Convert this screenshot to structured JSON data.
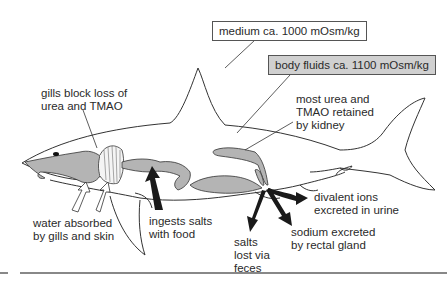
{
  "boxes": {
    "medium": "medium ca. 1000 mOsm/kg",
    "body_fluids": "body fluids ca. 1100 mOsm/kg"
  },
  "labels": {
    "gills_block": [
      "gills block loss of",
      "urea and TMAO"
    ],
    "kidney": [
      "most urea and",
      "TMAO retained",
      "by kidney"
    ],
    "water": [
      "water absorbed",
      "by gills and skin"
    ],
    "ingests": [
      "ingests salts",
      "with food"
    ],
    "divalent": [
      "divalent ions",
      "excreted in urine"
    ],
    "salts_feces": [
      "salts",
      "lost via",
      "feces"
    ],
    "sodium": [
      "sodium excreted",
      "by rectal gland"
    ]
  },
  "colors": {
    "organ_fill": "#b4b4b4",
    "outline": "#333333",
    "arrow": "#1a1a1a",
    "body_box": "#d0d0d0"
  }
}
